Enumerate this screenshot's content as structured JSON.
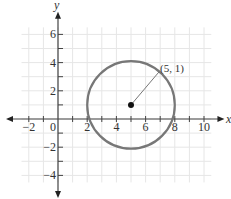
{
  "chart_data": {
    "type": "scatter",
    "title": "",
    "xlabel": "x",
    "ylabel": "y",
    "xlim": [
      -3,
      10.5
    ],
    "ylim": [
      -4.5,
      6.5
    ],
    "grid": true,
    "x_ticks": [
      "-2",
      "0",
      "2",
      "4",
      "6",
      "8",
      "10"
    ],
    "y_ticks": [
      "6",
      "4",
      "2",
      "-2",
      "-4"
    ],
    "circle": {
      "center": [
        5,
        1
      ],
      "radius": 3
    },
    "points": [
      {
        "x": 5,
        "y": 1,
        "label": "(5, 1)"
      }
    ]
  },
  "labels": {
    "x_axis": "x",
    "y_axis": "y",
    "point": "(5, 1)"
  }
}
